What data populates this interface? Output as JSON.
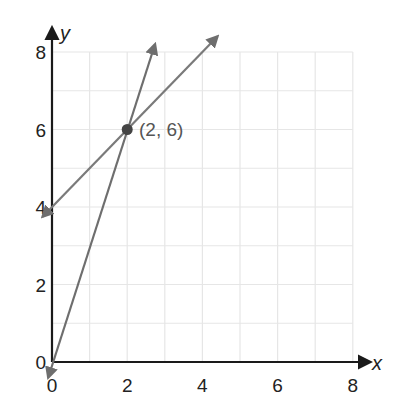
{
  "chart_data": {
    "type": "line",
    "title": "",
    "xlabel": "x",
    "ylabel": "y",
    "xlim": [
      0,
      8
    ],
    "ylim": [
      0,
      8
    ],
    "grid": true,
    "x_ticks": [
      "0",
      "2",
      "4",
      "6",
      "8"
    ],
    "y_ticks": [
      "0",
      "2",
      "4",
      "6",
      "8"
    ],
    "series": [
      {
        "name": "line through origin (y = 3x)",
        "color": "#6e6e6e",
        "x": [
          -0.1,
          2.74
        ],
        "y": [
          -0.4,
          8.2
        ],
        "arrows": "both"
      },
      {
        "name": "line with y-intercept 4 (y = x + 4)",
        "color": "#7a7a7a",
        "x": [
          -0.25,
          4.4
        ],
        "y": [
          3.75,
          8.4
        ],
        "arrows": "both"
      }
    ],
    "points": [
      {
        "x": 2,
        "y": 6,
        "label": "(2, 6)",
        "color": "#444444"
      }
    ]
  },
  "labels": {
    "x_axis": "x",
    "y_axis": "y",
    "point_label": "(2, 6)",
    "x_ticks": [
      "0",
      "2",
      "4",
      "6",
      "8"
    ],
    "y_ticks": [
      "0",
      "2",
      "4",
      "6",
      "8"
    ]
  }
}
